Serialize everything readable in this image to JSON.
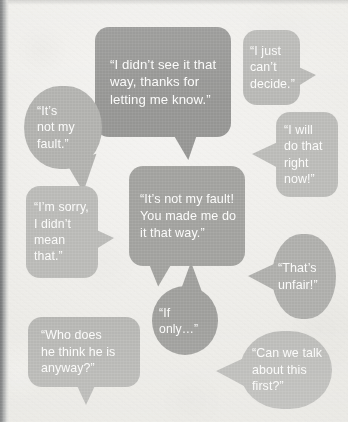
{
  "scene": {
    "kind": "speech-bubble-illustration",
    "background_color": "#efeeea",
    "spine_color": "#6d6f70",
    "text_color": "#fbfbfa"
  },
  "bubbles": [
    {
      "id": "bubble-didnt-see-it-that-way",
      "text": "“I didn’t see it that\nway, thanks for\nletting me know.”",
      "shape": "rect",
      "fill": "#979795",
      "tail": "bottom-right",
      "x": 95,
      "y": 27,
      "w": 136,
      "h": 110,
      "font_size": 13.2,
      "line_height": 17.5,
      "pad_left": 15,
      "pad_top": 0
    },
    {
      "id": "bubble-cant-decide",
      "text": "“I just\ncan’t\ndecide.”",
      "shape": "rect",
      "fill": "#b9b9b6",
      "tail": "right",
      "x": 243,
      "y": 30,
      "w": 57,
      "h": 75,
      "font_size": 12.4,
      "line_height": 16.5,
      "pad_left": 7,
      "pad_top": 0
    },
    {
      "id": "bubble-not-my-fault-short",
      "text": "“It’s\nnot my\nfault.”",
      "shape": "pill",
      "fill": "#b3b3b0",
      "tail": "bottom-right",
      "x": 24,
      "y": 86,
      "w": 78,
      "h": 83,
      "font_size": 12.4,
      "line_height": 16.5,
      "pad_left": 13,
      "pad_top": 0
    },
    {
      "id": "bubble-i-will-do-that-right-now",
      "text": "“I will\ndo that\nright\nnow!”",
      "shape": "rect",
      "fill": "#bdbdba",
      "tail": "left",
      "x": 276,
      "y": 112,
      "w": 62,
      "h": 85,
      "font_size": 12.4,
      "line_height": 16.4,
      "pad_left": 8,
      "pad_top": 0
    },
    {
      "id": "bubble-not-my-fault-you-made-me",
      "text": "“It’s not my fault!\nYou made me do\nit that way.”",
      "shape": "rect",
      "fill": "#a3a3a0",
      "tail": "bottom-left",
      "x": 129,
      "y": 166,
      "w": 116,
      "h": 100,
      "font_size": 12.6,
      "line_height": 17,
      "pad_left": 11,
      "pad_top": 0
    },
    {
      "id": "bubble-im-sorry-didnt-mean-that",
      "text": "“I’m sorry,\nI didn’t\nmean\nthat.”",
      "shape": "rect",
      "fill": "#bcbcb9",
      "tail": "right",
      "x": 26,
      "y": 186,
      "w": 72,
      "h": 92,
      "font_size": 12.3,
      "line_height": 16.4,
      "pad_left": 8,
      "pad_top": 0
    },
    {
      "id": "bubble-thats-unfair",
      "text": "“That’s\nunfair!”",
      "shape": "pill",
      "fill": "#b0b0ad",
      "tail": "left",
      "x": 272,
      "y": 234,
      "w": 64,
      "h": 85,
      "font_size": 12.5,
      "line_height": 16.6,
      "pad_left": 6,
      "pad_top": 0
    },
    {
      "id": "bubble-if-only",
      "text": "“If only…”",
      "shape": "round",
      "fill": "#a0a09d",
      "tail": "top",
      "x": 152,
      "y": 286,
      "w": 66,
      "h": 69,
      "font_size": 12.2,
      "line_height": 16,
      "pad_left": 7,
      "pad_top": 0
    },
    {
      "id": "bubble-who-does-he-think-he-is",
      "text": "“Who does\nhe think he is\nanyway?”",
      "shape": "rect",
      "fill": "#b8b8b5",
      "tail": "bottom",
      "x": 28,
      "y": 317,
      "w": 112,
      "h": 70,
      "font_size": 12.4,
      "line_height": 16.6,
      "pad_left": 13,
      "pad_top": 0
    },
    {
      "id": "bubble-can-we-talk-about-this-first",
      "text": "“Can we talk\nabout this\nfirst?”",
      "shape": "pill",
      "fill": "#bdbdba",
      "tail": "left",
      "x": 240,
      "y": 331,
      "w": 92,
      "h": 78,
      "font_size": 12.4,
      "line_height": 16.6,
      "pad_left": 12,
      "pad_top": 0
    }
  ]
}
